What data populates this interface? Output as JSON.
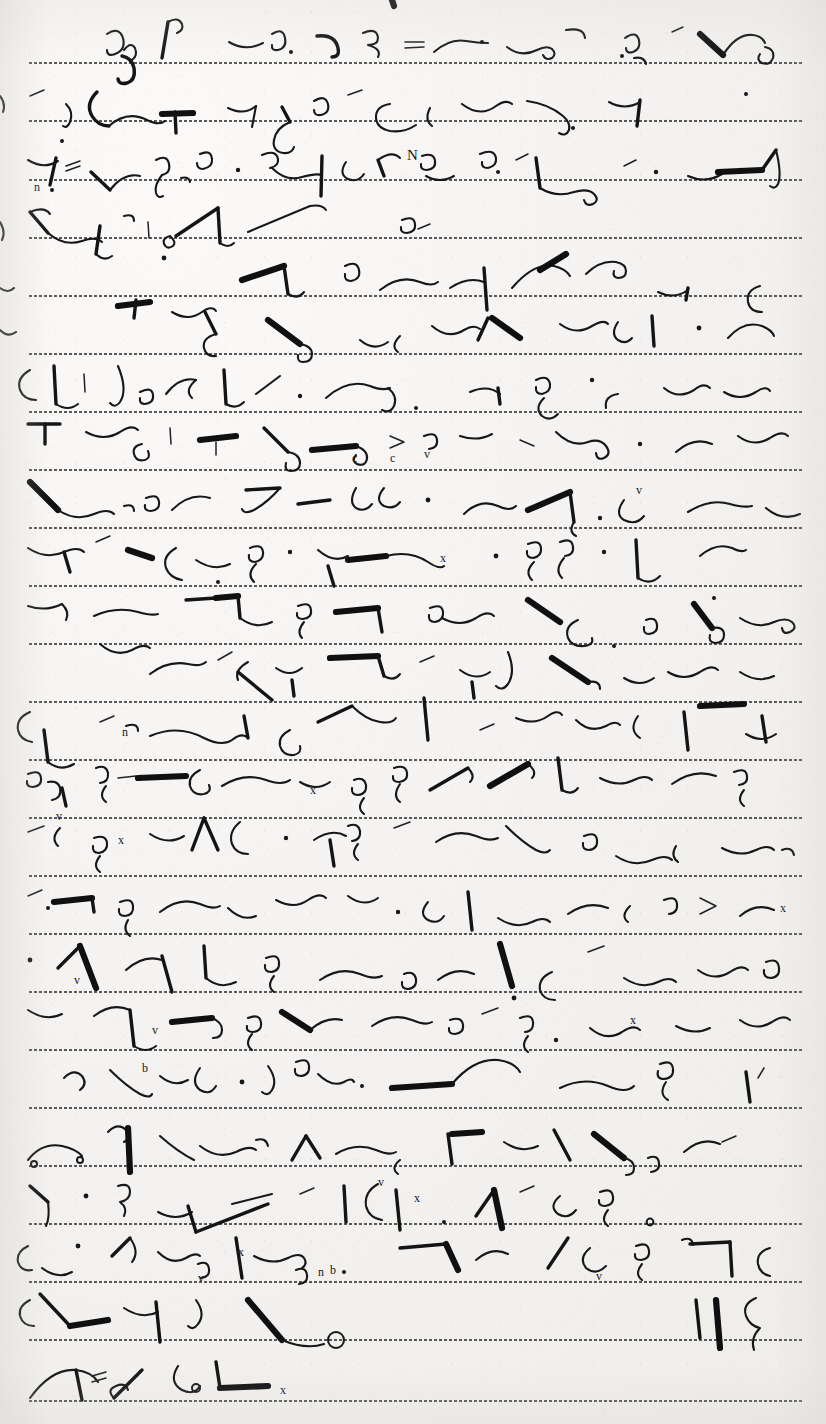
{
  "document": {
    "kind": "handwritten-shorthand-page",
    "script_system": "Gregg shorthand",
    "media": "dotted ruled notepaper",
    "ink_color": "#17171a",
    "paper_color": "#f4f3f1",
    "rule_color": "#4a4a4a",
    "legible_text": "",
    "title": "",
    "page_number": "",
    "header": "",
    "footer": ""
  },
  "canvas": {
    "width": 826,
    "height": 1424
  },
  "ruling": {
    "style": "dotted",
    "dot_spacing_px": 5,
    "line_count": 24,
    "left_px": 28,
    "right_px": 802,
    "y_positions": [
      62,
      120,
      179,
      237,
      295,
      353,
      411,
      469,
      527,
      585,
      643,
      701,
      759,
      817,
      875,
      933,
      991,
      1049,
      1107,
      1165,
      1223,
      1281,
      1339,
      1400
    ]
  },
  "annotations": {
    "latin_marks": [
      {
        "text": "n",
        "x": 38,
        "y": 189
      },
      {
        "text": "=",
        "x": 69,
        "y": 168
      },
      {
        "text": "N",
        "x": 413,
        "y": 158
      },
      {
        "text": "x",
        "x": 430,
        "y": 116
      },
      {
        "text": "v",
        "x": 569,
        "y": 47
      },
      {
        "text": "bn",
        "x": 104,
        "y": 363
      },
      {
        "text": "v",
        "x": 402,
        "y": 459
      },
      {
        "text": "c",
        "x": 356,
        "y": 452
      },
      {
        "text": "x",
        "x": 648,
        "y": 405
      },
      {
        "text": "v",
        "x": 657,
        "y": 443
      },
      {
        "text": "x",
        "x": 795,
        "y": 580
      },
      {
        "text": "x",
        "x": 444,
        "y": 756
      },
      {
        "text": "v",
        "x": 131,
        "y": 792
      },
      {
        "text": "x",
        "x": 196,
        "y": 818
      },
      {
        "text": "x",
        "x": 515,
        "y": 869
      },
      {
        "text": "v",
        "x": 726,
        "y": 1017
      },
      {
        "text": "x",
        "x": 637,
        "y": 1020
      },
      {
        "text": "x",
        "x": 1,
        "y": 1043
      },
      {
        "text": "v",
        "x": 1127,
        "y": 1170
      },
      {
        "text": "v",
        "x": 573,
        "y": 1193
      },
      {
        "text": "x",
        "x": 420,
        "y": 1197
      },
      {
        "text": "x",
        "x": 347,
        "y": 1245
      },
      {
        "text": "n",
        "x": 325,
        "y": 1270
      },
      {
        "text": "b",
        "x": 336,
        "y": 1268
      },
      {
        "text": "v",
        "x": 296,
        "y": 1274
      },
      {
        "text": "x",
        "x": 222,
        "y": 1397
      },
      {
        "text": "=",
        "x": 91,
        "y": 1375
      }
    ]
  },
  "strokes": {
    "description": "Outline strokes of shorthand characters rendered as vector paths; no transcribable plain text is present on the page."
  }
}
